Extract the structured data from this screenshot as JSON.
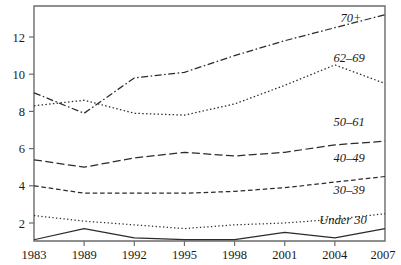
{
  "chart_data": {
    "type": "line",
    "title": "",
    "subtitle": "",
    "xlabel": "",
    "ylabel": "",
    "grid": false,
    "legend_position": "inline-right-labels",
    "x": [
      1983,
      1989,
      1992,
      1995,
      1998,
      2001,
      2004,
      2007
    ],
    "xtick_labels": [
      "1983",
      "1989",
      "1992",
      "1995",
      "1998",
      "2001",
      "2004",
      "2007"
    ],
    "ytick_labels": [
      "2",
      "4",
      "6",
      "8",
      "10",
      "12"
    ],
    "yticks": [
      2,
      4,
      6,
      8,
      10,
      12
    ],
    "xlim": [
      1983,
      2007
    ],
    "ylim": [
      0,
      13.8
    ],
    "series": [
      {
        "name": "70+",
        "label": "70+",
        "dash": "dash-dot",
        "values": [
          9.0,
          7.9,
          9.8,
          10.1,
          11.0,
          11.8,
          12.5,
          13.2
        ]
      },
      {
        "name": "62-69",
        "label": "62–69",
        "dash": "dotted",
        "values": [
          8.3,
          8.6,
          7.9,
          7.8,
          8.4,
          9.4,
          10.5,
          9.5
        ]
      },
      {
        "name": "50-61",
        "label": "50–61",
        "dash": "long-dash",
        "values": [
          5.4,
          5.0,
          5.5,
          5.8,
          5.6,
          5.8,
          6.2,
          6.4
        ]
      },
      {
        "name": "40-49",
        "label": "40–49",
        "dash": "medium-dash",
        "values": [
          4.0,
          3.6,
          3.6,
          3.6,
          3.7,
          3.9,
          4.2,
          4.5
        ]
      },
      {
        "name": "30-39",
        "label": "30–39",
        "dash": "fine-dot",
        "values": [
          2.4,
          2.1,
          1.9,
          1.7,
          1.9,
          2.0,
          2.2,
          2.5
        ]
      },
      {
        "name": "Under 30",
        "label": "Under 30",
        "dash": "solid",
        "values": [
          1.1,
          1.7,
          1.2,
          1.1,
          1.1,
          1.5,
          1.2,
          1.7
        ]
      }
    ],
    "series_label_positions": [
      {
        "name": "70+",
        "x": 351,
        "y": 22
      },
      {
        "name": "62-69",
        "x": 349,
        "y": 62
      },
      {
        "name": "50-61",
        "x": 349,
        "y": 126
      },
      {
        "name": "40-49",
        "x": 349,
        "y": 162
      },
      {
        "name": "30-39",
        "x": 349,
        "y": 194
      },
      {
        "name": "Under 30",
        "x": 343,
        "y": 224
      }
    ]
  },
  "axes": {
    "frame_color": "#6b6b6b",
    "line_color": "#2b2b2b"
  }
}
